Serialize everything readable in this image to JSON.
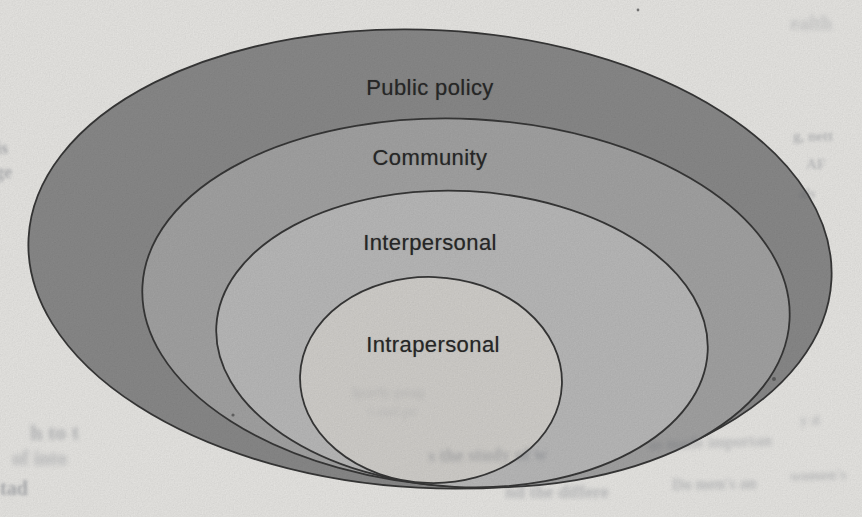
{
  "figure": {
    "background_color": "#ecebe8",
    "stroke_color": "#383838",
    "stroke_width": 1.8,
    "label_color": "#262626",
    "rings": [
      {
        "label": "Public policy",
        "fill": "#8c8c8c",
        "cx": 430,
        "cy": 259,
        "rx": 402,
        "ry": 229,
        "rotate": 3,
        "label_cx": 430,
        "label_cy": 88
      },
      {
        "label": "Community",
        "fill": "#a6a6a6",
        "cx": 466,
        "cy": 303,
        "rx": 324,
        "ry": 184,
        "rotate": 3,
        "label_cx": 430,
        "label_cy": 158
      },
      {
        "label": "Interpersonal",
        "fill": "#bdbdbd",
        "cx": 462,
        "cy": 339,
        "rx": 246,
        "ry": 148,
        "rotate": 3,
        "label_cx": 430,
        "label_cy": 243
      },
      {
        "label": "Intrapersonal",
        "fill": "#d5d3cf",
        "cx": 431,
        "cy": 380,
        "rx": 131,
        "ry": 103,
        "rotate": 2,
        "label_cx": 433,
        "label_cy": 345
      }
    ]
  },
  "scan_artifacts": {
    "note": "faint bleed-through text and specks from the scanned page",
    "ghost_fragments": [
      {
        "text": "ealth",
        "x": 790,
        "y": 12,
        "size": 20,
        "opacity": 0.2,
        "blur": 2.0,
        "rotate": 0
      },
      {
        "text": "g, nett",
        "x": 793,
        "y": 128,
        "size": 15,
        "opacity": 0.3,
        "blur": 1.8,
        "rotate": 0
      },
      {
        "text": "AF",
        "x": 806,
        "y": 156,
        "size": 15,
        "opacity": 0.28,
        "blur": 1.8,
        "rotate": 0
      },
      {
        "text": "als",
        "x": 799,
        "y": 186,
        "size": 14,
        "opacity": 0.26,
        "blur": 1.8,
        "rotate": 0
      },
      {
        "text": "is",
        "x": -4,
        "y": 138,
        "size": 18,
        "opacity": 0.4,
        "blur": 1.5,
        "rotate": 0
      },
      {
        "text": "ge",
        "x": -5,
        "y": 162,
        "size": 18,
        "opacity": 0.38,
        "blur": 1.5,
        "rotate": 0
      },
      {
        "text": "h to t",
        "x": 30,
        "y": 420,
        "size": 22,
        "opacity": 0.35,
        "blur": 2.2,
        "rotate": -1
      },
      {
        "text": "of into",
        "x": 12,
        "y": 447,
        "size": 20,
        "opacity": 0.3,
        "blur": 2.4,
        "rotate": 0
      },
      {
        "text": "tad",
        "x": 0,
        "y": 477,
        "size": 20,
        "opacity": 0.42,
        "blur": 1.8,
        "rotate": 0
      },
      {
        "text": "s the study of w",
        "x": 428,
        "y": 446,
        "size": 18,
        "opacity": 0.3,
        "blur": 2.0,
        "rotate": -1
      },
      {
        "text": "as made importan",
        "x": 648,
        "y": 436,
        "size": 16,
        "opacity": 0.28,
        "blur": 2.2,
        "rotate": -2
      },
      {
        "text": "nd the differe",
        "x": 505,
        "y": 482,
        "size": 18,
        "opacity": 0.32,
        "blur": 2.0,
        "rotate": 0
      },
      {
        "text": "Do men's an",
        "x": 672,
        "y": 476,
        "size": 16,
        "opacity": 0.3,
        "blur": 2.0,
        "rotate": -1
      },
      {
        "text": "women's",
        "x": 790,
        "y": 468,
        "size": 15,
        "opacity": 0.28,
        "blur": 2.0,
        "rotate": -2
      },
      {
        "text": "y d",
        "x": 800,
        "y": 412,
        "size": 15,
        "opacity": 0.25,
        "blur": 2.0,
        "rotate": 0
      },
      {
        "text": "lparly peag",
        "x": 352,
        "y": 384,
        "size": 15,
        "opacity": 0.13,
        "blur": 2.5,
        "rotate": 0
      },
      {
        "text": "t and pe",
        "x": 368,
        "y": 404,
        "size": 14,
        "opacity": 0.11,
        "blur": 2.5,
        "rotate": 0
      }
    ],
    "specks": [
      {
        "x": 233,
        "y": 415,
        "r": 1.6
      },
      {
        "x": 774,
        "y": 379,
        "r": 2.0
      },
      {
        "x": 638,
        "y": 10,
        "r": 1.4
      }
    ]
  }
}
